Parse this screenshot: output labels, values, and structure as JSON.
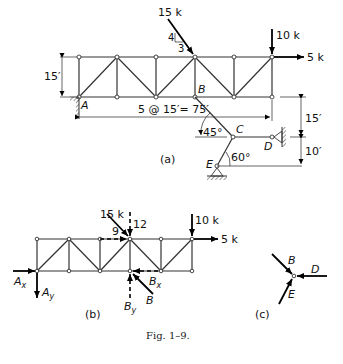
{
  "figure": {
    "caption": "Fig. 1–9.",
    "panel_a": {
      "label": "(a)",
      "load_inclined": "15 k",
      "slope_rise": "4",
      "slope_run": "3",
      "load_vertical": "10 k",
      "load_horizontal": "5 k",
      "height_dim": "15′",
      "span_dim": "5 @ 15′= 75′",
      "node_A": "A",
      "node_B": "B",
      "node_C": "C",
      "node_D": "D",
      "node_E": "E",
      "angle_BC": "45°",
      "angle_EC": "60°",
      "dim_upper": "15′",
      "dim_lower": "10′"
    },
    "panel_b": {
      "label": "(b)",
      "load_inclined": "15 k",
      "comp_h": "9",
      "comp_v": "12",
      "load_vertical": "10 k",
      "load_horizontal": "5 k",
      "Ax": "A",
      "Ax_sub": "x",
      "Ay": "A",
      "Ay_sub": "y",
      "By": "B",
      "By_sub": "y",
      "Bx": "B",
      "Bx_sub": "x",
      "B": "B"
    },
    "panel_c": {
      "label": "(c)",
      "B": "B",
      "D": "D",
      "E": "E"
    }
  }
}
